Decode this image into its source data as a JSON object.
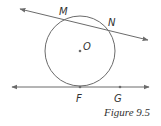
{
  "figure": {
    "caption": "Figure 9.5",
    "stroke_color": "#6b6b6b",
    "label_color": "#333333",
    "circle": {
      "center_label": "O",
      "cx": 80,
      "cy": 51,
      "r": 35
    },
    "secant": {
      "label_1": "M",
      "label_2": "N"
    },
    "tangent": {
      "point_of_tangency_label": "F",
      "other_point_label": "G"
    }
  }
}
